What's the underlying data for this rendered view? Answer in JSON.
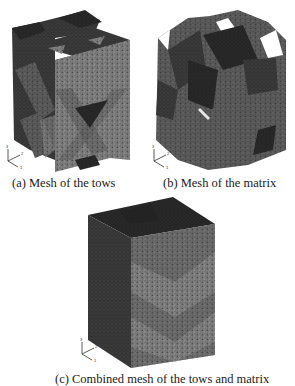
{
  "figure": {
    "panels": [
      {
        "id": "a",
        "caption": "(a) Mesh of the tows"
      },
      {
        "id": "b",
        "caption": "(b) Mesh of the matrix"
      },
      {
        "id": "c",
        "caption": "(c) Combined mesh of the tows and matrix"
      }
    ],
    "axis_triad": {
      "labels": [
        "3",
        "2",
        "1"
      ]
    },
    "colors": {
      "background": "#ffffff",
      "mesh_light": "#8a8a8a",
      "mesh_mid": "#5e5e5e",
      "mesh_dark": "#3a3a3a",
      "mesh_darkest": "#262626",
      "caption_text": "#1a1a1a"
    }
  }
}
